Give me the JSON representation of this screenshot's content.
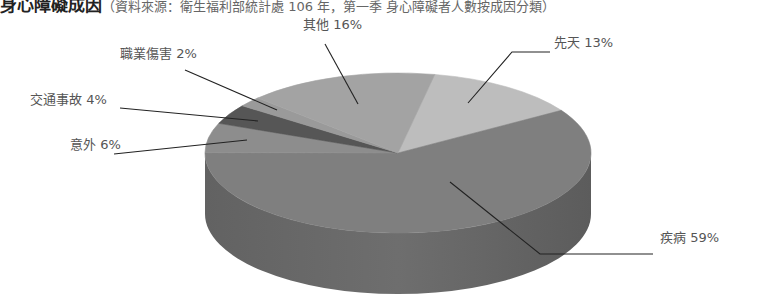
{
  "caption": {
    "title": "身心障礙成因",
    "source": "（資料來源：衛生福利部統計處 106 年，第一季 身心障礙者人數按成因分類）"
  },
  "chart_data": {
    "type": "pie",
    "style": "3d",
    "title": "身心障礙成因",
    "categories": [
      "先天",
      "疾病",
      "意外",
      "交通事故",
      "職業傷害",
      "其他"
    ],
    "values": [
      13,
      59,
      6,
      4,
      2,
      16
    ],
    "unit": "%",
    "start_angle_deg": -79,
    "labels": [
      {
        "text": "先天 13%",
        "x": 554,
        "y": 43
      },
      {
        "text": "疾病 59%",
        "x": 660,
        "y": 238
      },
      {
        "text": "意外 6%",
        "x": 70,
        "y": 145
      },
      {
        "text": "交通事故 4%",
        "x": 30,
        "y": 100
      },
      {
        "text": "職業傷害 2%",
        "x": 120,
        "y": 54
      },
      {
        "text": "其他 16%",
        "x": 303,
        "y": 25
      }
    ],
    "colors": {
      "先天": "#bdbdbd",
      "疾病": "#7f7f7f",
      "意外": "#8d8d8d",
      "交通事故": "#565656",
      "職業傷害": "#9a9a9a",
      "其他": "#a3a3a3",
      "side": "#6b6b6b",
      "side_dark": "#5f5f5f",
      "leader": "#222222"
    },
    "leaders": [
      {
        "points": [
          [
            468,
            103
          ],
          [
            512,
            52
          ],
          [
            550,
            52
          ]
        ]
      },
      {
        "points": [
          [
            450,
            182
          ],
          [
            540,
            254
          ],
          [
            653,
            254
          ]
        ]
      },
      {
        "points": [
          [
            247,
            140
          ],
          [
            114,
            154
          ]
        ]
      },
      {
        "points": [
          [
            258,
            121
          ],
          [
            120,
            108
          ]
        ]
      },
      {
        "points": [
          [
            277,
            110
          ],
          [
            185,
            70
          ]
        ]
      },
      {
        "points": [
          [
            358,
            104
          ],
          [
            325,
            44
          ]
        ]
      }
    ]
  }
}
